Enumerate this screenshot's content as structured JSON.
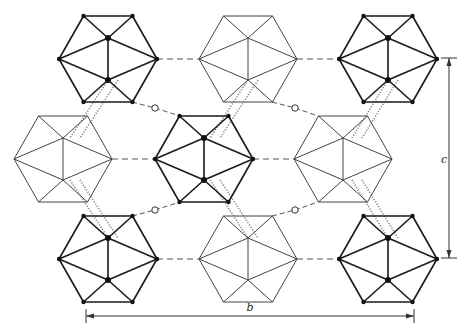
{
  "diagram": {
    "type": "crystal-structure-projection",
    "colors": {
      "bold": "#1a1a1a",
      "light": "#444444",
      "hbond": "#555555",
      "dotted": "#888888",
      "oxygen_fill": "#ffffff"
    },
    "icosahedra": [
      {
        "id": "r1c1",
        "cx": 108,
        "cy": 59,
        "style": "bold"
      },
      {
        "id": "r1c2",
        "cx": 248,
        "cy": 59,
        "style": "light"
      },
      {
        "id": "r1c3",
        "cx": 388,
        "cy": 59,
        "style": "bold"
      },
      {
        "id": "r2c1",
        "cx": 63,
        "cy": 159,
        "style": "light"
      },
      {
        "id": "r2c2",
        "cx": 204,
        "cy": 159,
        "style": "bold"
      },
      {
        "id": "r2c3",
        "cx": 343,
        "cy": 159,
        "style": "light"
      },
      {
        "id": "r3c1",
        "cx": 108,
        "cy": 259,
        "style": "bold"
      },
      {
        "id": "r3c2",
        "cx": 248,
        "cy": 259,
        "style": "light"
      },
      {
        "id": "r3c3",
        "cx": 388,
        "cy": 259,
        "style": "bold"
      }
    ],
    "hexagon": {
      "half_width": 49,
      "half_height": 43,
      "inner_offset": 21
    },
    "dashed_links": [
      [
        157,
        59,
        199,
        59
      ],
      [
        297,
        59,
        339,
        59
      ],
      [
        112,
        159,
        155,
        159
      ],
      [
        253,
        159,
        294,
        159
      ],
      [
        157,
        259,
        199,
        259
      ],
      [
        297,
        259,
        339,
        259
      ]
    ],
    "oxygen_links": [
      {
        "from": [
          132,
          102
        ],
        "o": [
          155,
          108
        ],
        "to": [
          180,
          116
        ]
      },
      {
        "from": [
          272,
          102
        ],
        "o": [
          295,
          108
        ],
        "to": [
          318,
          116
        ]
      },
      {
        "from": [
          132,
          216
        ],
        "o": [
          155,
          210
        ],
        "to": [
          180,
          202
        ]
      },
      {
        "from": [
          272,
          216
        ],
        "o": [
          295,
          210
        ],
        "to": [
          318,
          202
        ]
      }
    ],
    "dotted_links": [
      [
        108,
        80,
        70,
        138
      ],
      [
        118,
        80,
        80,
        138
      ],
      [
        70,
        180,
        108,
        238
      ],
      [
        80,
        180,
        118,
        238
      ],
      [
        248,
        80,
        210,
        138
      ],
      [
        258,
        80,
        220,
        138
      ],
      [
        210,
        180,
        248,
        238
      ],
      [
        220,
        180,
        258,
        238
      ],
      [
        388,
        80,
        352,
        138
      ],
      [
        398,
        80,
        362,
        138
      ],
      [
        352,
        180,
        388,
        238
      ],
      [
        362,
        180,
        398,
        238
      ]
    ],
    "dimension_c": {
      "label": "c",
      "x": 449,
      "y1": 58,
      "y2": 258,
      "label_x": 441,
      "label_y": 163
    },
    "dimension_b": {
      "label": "b",
      "y": 316,
      "x1": 86,
      "x2": 414,
      "label_x": 250,
      "label_y": 311
    }
  }
}
